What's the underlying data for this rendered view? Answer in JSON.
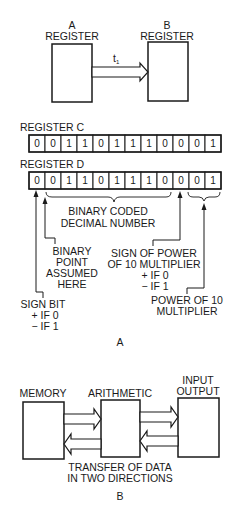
{
  "figure_a": {
    "caption": "A",
    "register_a": {
      "label_line1": "A",
      "label_line2": "REGISTER"
    },
    "register_b": {
      "label_line1": "B",
      "label_line2": "REGISTER"
    },
    "transfer_label": "t",
    "transfer_subscript": "1",
    "register_c": {
      "label": "REGISTER C",
      "bits": [
        "0",
        "0",
        "1",
        "1",
        "0",
        "1",
        "1",
        "1",
        "0",
        "0",
        "0",
        "1"
      ]
    },
    "register_d": {
      "label": "REGISTER D",
      "bits": [
        "0",
        "0",
        "1",
        "1",
        "0",
        "1",
        "1",
        "1",
        "0",
        "0",
        "0",
        "1"
      ]
    },
    "annotations": {
      "bcd_line1": "BINARY CODED",
      "bcd_line2": "DECIMAL NUMBER",
      "binary_point_line1": "BINARY",
      "binary_point_line2": "POINT",
      "binary_point_line3": "ASSUMED",
      "binary_point_line4": "HERE",
      "sign_power_line1": "SIGN OF POWER",
      "sign_power_line2": "OF 10 MULTIPLIER",
      "sign_power_line3": "+  IF 0",
      "sign_power_line4": "−  IF 1",
      "sign_bit_line1": "SIGN BIT",
      "sign_bit_line2": "+  IF 0",
      "sign_bit_line3": "−  IF 1",
      "power_line1": "POWER OF 10",
      "power_line2": "MULTIPLIER"
    }
  },
  "figure_b": {
    "caption": "B",
    "memory_label": "MEMORY",
    "arithmetic_label": "ARITHMETIC",
    "io_label_line1": "INPUT",
    "io_label_line2": "OUTPUT",
    "transfer_line1": "TRANSFER OF DATA",
    "transfer_line2": "IN TWO DIRECTIONS"
  }
}
